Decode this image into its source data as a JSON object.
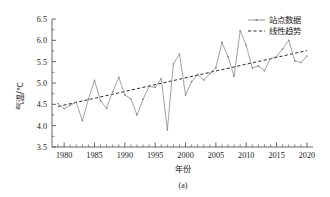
{
  "figure": {
    "caption": "(a)"
  },
  "legend": {
    "position": "top-right",
    "items": [
      {
        "label": "站点数据",
        "style": "solid-with-markers",
        "color": "#8a8a8a"
      },
      {
        "label": "线性趋势",
        "style": "dashed",
        "color": "#2b2b2b"
      }
    ]
  },
  "colors": {
    "series": "#8a8a8a",
    "trend": "#2b2b2b",
    "axis": "#555555",
    "text": "#1a1a1a",
    "background": "#ffffff"
  },
  "chart_data": {
    "type": "line",
    "title": "",
    "subtitle": "",
    "xlabel": "年份",
    "ylabel": "气温/℃",
    "xlim": [
      1978,
      2021
    ],
    "ylim": [
      3.5,
      6.5
    ],
    "grid": false,
    "x_major_ticks": [
      1980,
      1985,
      1990,
      1995,
      2000,
      2005,
      2010,
      2015,
      2020
    ],
    "x_minor_tick_step": 1,
    "y_major_ticks": [
      3.5,
      4.0,
      4.5,
      5.0,
      5.5,
      6.0,
      6.5
    ],
    "x_tick_labels": [
      "1980",
      "1985",
      "1990",
      "1995",
      "2000",
      "2005",
      "2010",
      "2015",
      "2020"
    ],
    "y_tick_labels": [
      "3.5",
      "4.0",
      "4.5",
      "5.0",
      "5.5",
      "6.0",
      "6.5"
    ],
    "legend": [
      "站点数据",
      "线性趋势"
    ],
    "x": [
      1979,
      1980,
      1981,
      1982,
      1983,
      1984,
      1985,
      1986,
      1987,
      1988,
      1989,
      1990,
      1991,
      1992,
      1993,
      1994,
      1995,
      1996,
      1997,
      1998,
      1999,
      2000,
      2001,
      2002,
      2003,
      2004,
      2005,
      2006,
      2007,
      2008,
      2009,
      2010,
      2011,
      2012,
      2013,
      2014,
      2015,
      2016,
      2017,
      2018,
      2019,
      2020
    ],
    "series": [
      {
        "name": "站点数据",
        "values": [
          4.52,
          4.4,
          4.48,
          4.55,
          4.12,
          4.62,
          5.06,
          4.58,
          4.41,
          4.8,
          5.13,
          4.72,
          4.63,
          4.25,
          4.62,
          4.92,
          4.9,
          5.1,
          3.9,
          5.45,
          5.68,
          4.72,
          5.03,
          5.2,
          5.07,
          5.22,
          5.36,
          5.95,
          5.62,
          5.16,
          6.22,
          5.88,
          5.35,
          5.4,
          5.29,
          5.57,
          5.62,
          5.8,
          6.0,
          5.52,
          5.48,
          5.63
        ]
      },
      {
        "name": "线性趋势",
        "values": [
          4.45,
          4.48,
          4.51,
          4.55,
          4.58,
          4.61,
          4.64,
          4.67,
          4.7,
          4.74,
          4.77,
          4.8,
          4.83,
          4.86,
          4.9,
          4.93,
          4.96,
          4.99,
          5.02,
          5.06,
          5.09,
          5.12,
          5.15,
          5.18,
          5.22,
          5.25,
          5.28,
          5.31,
          5.34,
          5.38,
          5.41,
          5.44,
          5.47,
          5.5,
          5.54,
          5.57,
          5.6,
          5.63,
          5.66,
          5.7,
          5.73,
          5.76
        ]
      }
    ]
  }
}
